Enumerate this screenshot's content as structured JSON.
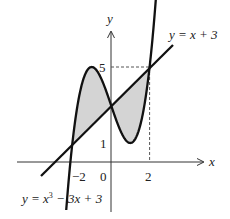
{
  "diagram": {
    "type": "function-graph",
    "axes": {
      "x_label": "x",
      "y_label": "y",
      "x_ticks": [
        "−2",
        "0",
        "2"
      ],
      "y_ticks": [
        "1",
        "5"
      ]
    },
    "curves": [
      {
        "name": "cubic",
        "equation": "y = x³ − 3x + 3",
        "label_prefix": "y = x",
        "label_sup": "3",
        "label_suffix": " − 3x + 3"
      },
      {
        "name": "line",
        "equation": "y = x + 3",
        "label": "y = x + 3"
      }
    ],
    "intersections": [
      [
        -2,
        1
      ],
      [
        0,
        3
      ],
      [
        2,
        5
      ]
    ],
    "shaded_region": "area enclosed between the cubic and the line from x = −2 to x = 2",
    "colors": {
      "curve": "#111111",
      "shade": "#d4d4d4",
      "axis": "#333333",
      "dashed": "#555555"
    }
  }
}
